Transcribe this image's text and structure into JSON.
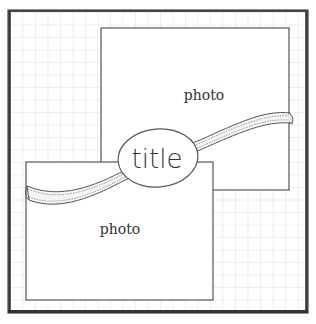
{
  "sketch": {
    "background": "#ffffff",
    "grid_color": "#d4d4d4",
    "frame_color": "#333333",
    "grid_spacing": 12.5
  },
  "photos": [
    {
      "label": "photo",
      "x": 101,
      "y": 28,
      "w": 188,
      "h": 162
    },
    {
      "label": "photo",
      "x": 26,
      "y": 162,
      "w": 187,
      "h": 138
    }
  ],
  "title": {
    "label": "title"
  }
}
